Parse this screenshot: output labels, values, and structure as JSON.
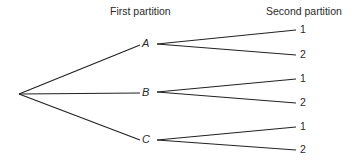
{
  "headers": {
    "first": "First partition",
    "second": "Second partition"
  },
  "nodes": [
    {
      "label": "A",
      "leaves": [
        "1",
        "2"
      ]
    },
    {
      "label": "B",
      "leaves": [
        "1",
        "2"
      ]
    },
    {
      "label": "C",
      "leaves": [
        "1",
        "2"
      ]
    }
  ],
  "colors": {
    "line": "#222222",
    "text": "#2a2a2a",
    "background": "#ffffff"
  }
}
